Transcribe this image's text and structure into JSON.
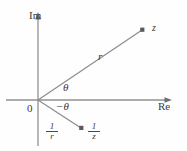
{
  "figure": {
    "background_color": "#fefefe",
    "line_color": "#808080",
    "text_color": "#3a3a3a",
    "width": 187,
    "height": 151
  },
  "axes": {
    "imaginary_label": "Im",
    "real_label": "Re",
    "origin_label": "0",
    "origin": {
      "x": 38,
      "y": 100
    },
    "vertical": {
      "x": 38,
      "y_top": 14,
      "y_bottom": 146
    },
    "horizontal": {
      "y": 100,
      "x_left": 6,
      "x_right": 172
    }
  },
  "rays": [
    {
      "name": "ray-to-z",
      "from": {
        "x": 38,
        "y": 100
      },
      "to": {
        "x": 143,
        "y": 30
      },
      "length_label": "r",
      "angle_label": "θ",
      "endpoint_label": "z",
      "endpoint_marker": true
    },
    {
      "name": "ray-to-one-over-z",
      "from": {
        "x": 38,
        "y": 100
      },
      "to": {
        "x": 82,
        "y": 128
      },
      "length_label_numerator": "1",
      "length_label_denominator": "r",
      "angle_label": "−θ",
      "endpoint_label_numerator": "1",
      "endpoint_label_denominator": "z",
      "endpoint_marker": true
    }
  ],
  "labels": {
    "im": "Im",
    "re": "Re",
    "origin": "0",
    "r": "r",
    "theta": "θ",
    "neg_theta": "−θ",
    "z": "z",
    "frac_r_num": "1",
    "frac_r_den": "r",
    "frac_z_num": "1",
    "frac_z_den": "z"
  }
}
